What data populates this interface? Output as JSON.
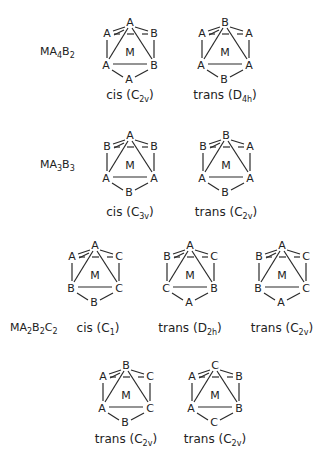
{
  "rows": [
    {
      "formula": {
        "main": "MA",
        "parts": [
          [
            "MA",
            ""
          ],
          [
            "4",
            ""
          ],
          [
            "B",
            ""
          ],
          [
            "2",
            ""
          ]
        ],
        "text": "MA4B2"
      },
      "isomers": [
        {
          "caption": "cis",
          "symmetry": "C2v",
          "center": "M",
          "top": "A",
          "ul": "A",
          "ur": "B",
          "ll": "A",
          "lr": "B",
          "bottom": "A"
        },
        {
          "caption": "trans",
          "symmetry": "D4h",
          "center": "M",
          "top": "B",
          "ul": "A",
          "ur": "A",
          "ll": "A",
          "lr": "A",
          "bottom": "B"
        }
      ]
    },
    {
      "formula": {
        "text": "MA3B3"
      },
      "isomers": [
        {
          "caption": "cis",
          "symmetry": "C3v",
          "center": "M",
          "top": "A",
          "ul": "B",
          "ur": "B",
          "ll": "A",
          "lr": "A",
          "bottom": "B"
        },
        {
          "caption": "trans",
          "symmetry": "C2v",
          "center": "M",
          "top": "B",
          "ul": "B",
          "ur": "A",
          "ll": "A",
          "lr": "A",
          "bottom": "B"
        }
      ]
    },
    {
      "formula": {
        "text": "MA2B2C2"
      },
      "isomers": [
        {
          "caption": "cis",
          "symmetry": "C1",
          "center": "M",
          "top": "A",
          "ul": "A",
          "ur": "C",
          "ll": "B",
          "lr": "C",
          "bottom": "B"
        },
        {
          "caption": "trans",
          "symmetry": "D2h",
          "center": "M",
          "top": "A",
          "ul": "B",
          "ur": "C",
          "ll": "C",
          "lr": "B",
          "bottom": "A"
        },
        {
          "caption": "trans",
          "symmetry": "C2v",
          "center": "M",
          "top": "A",
          "ul": "B",
          "ur": "C",
          "ll": "B",
          "lr": "C",
          "bottom": "A"
        }
      ]
    },
    {
      "formula": {
        "text": ""
      },
      "isomers": [
        {
          "caption": "trans",
          "symmetry": "C2v",
          "center": "M",
          "top": "B",
          "ul": "A",
          "ur": "C",
          "ll": "A",
          "lr": "C",
          "bottom": "B"
        },
        {
          "caption": "trans",
          "symmetry": "C2v",
          "center": "M",
          "top": "C",
          "ul": "A",
          "ur": "B",
          "ll": "A",
          "lr": "B",
          "bottom": "C"
        }
      ]
    }
  ]
}
